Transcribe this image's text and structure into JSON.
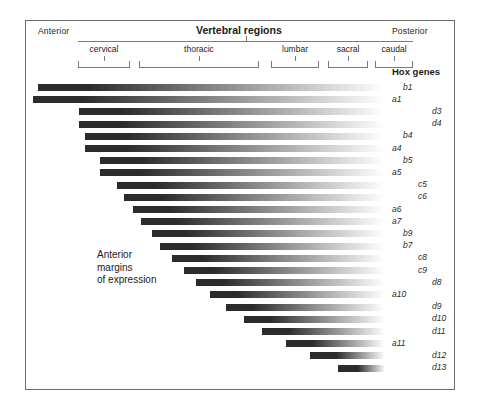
{
  "figure": {
    "title_main": "Vertebral regions",
    "anterior_label": "Anterior",
    "posterior_label": "Posterior",
    "hox_genes_label": "Hox genes",
    "annotation": "Anterior\nmargins\nof expression",
    "annotation_lines": [
      "Anterior",
      "margins",
      "of expression"
    ],
    "bar_color_dark": "#2b2b2b",
    "bar_color_light": "#ffffff",
    "frame_color": "#6e6e6e",
    "text_color": "#1b1b1b"
  },
  "regions": [
    {
      "name": "cervical",
      "x": 78,
      "width": 52
    },
    {
      "name": "thoracic",
      "x": 139,
      "width": 120
    },
    {
      "name": "lumbar",
      "x": 271,
      "width": 48
    },
    {
      "name": "sacral",
      "x": 328,
      "width": 40
    },
    {
      "name": "caudal",
      "x": 375,
      "width": 38
    }
  ],
  "chart_data": {
    "type": "bar",
    "xlabel": "Anterior — Posterior body axis",
    "ylabel": "Hox genes",
    "axis_note": "All expression domains extend to the posterior end; left edge marks the anterior margin.",
    "categories": [
      "b1",
      "a1",
      "d3",
      "d4",
      "b4",
      "a4",
      "b5",
      "a5",
      "c5",
      "c6",
      "a6",
      "a7",
      "b9",
      "b7",
      "c8",
      "c9",
      "d8",
      "a10",
      "d9",
      "d10",
      "d11",
      "a11",
      "d12",
      "d13"
    ],
    "bars": [
      {
        "gene": "b1",
        "cluster": "b",
        "paralog": 1,
        "start": 38,
        "end": 385,
        "indent": 1
      },
      {
        "gene": "a1",
        "cluster": "a",
        "paralog": 1,
        "start": 33,
        "end": 385,
        "indent": 0
      },
      {
        "gene": "d3",
        "cluster": "d",
        "paralog": 3,
        "start": 79,
        "end": 385,
        "indent": 3
      },
      {
        "gene": "d4",
        "cluster": "d",
        "paralog": 4,
        "start": 79,
        "end": 385,
        "indent": 3
      },
      {
        "gene": "b4",
        "cluster": "b",
        "paralog": 4,
        "start": 85,
        "end": 385,
        "indent": 1
      },
      {
        "gene": "a4",
        "cluster": "a",
        "paralog": 4,
        "start": 85,
        "end": 385,
        "indent": 0
      },
      {
        "gene": "b5",
        "cluster": "b",
        "paralog": 5,
        "start": 100,
        "end": 385,
        "indent": 1
      },
      {
        "gene": "a5",
        "cluster": "a",
        "paralog": 5,
        "start": 100,
        "end": 385,
        "indent": 0
      },
      {
        "gene": "c5",
        "cluster": "c",
        "paralog": 5,
        "start": 117,
        "end": 385,
        "indent": 2
      },
      {
        "gene": "c6",
        "cluster": "c",
        "paralog": 6,
        "start": 124,
        "end": 385,
        "indent": 2
      },
      {
        "gene": "a6",
        "cluster": "a",
        "paralog": 6,
        "start": 133,
        "end": 385,
        "indent": 0
      },
      {
        "gene": "a7",
        "cluster": "a",
        "paralog": 7,
        "start": 141,
        "end": 385,
        "indent": 0
      },
      {
        "gene": "b9",
        "cluster": "b",
        "paralog": 9,
        "start": 152,
        "end": 385,
        "indent": 1
      },
      {
        "gene": "b7",
        "cluster": "b",
        "paralog": 7,
        "start": 160,
        "end": 385,
        "indent": 1
      },
      {
        "gene": "c8",
        "cluster": "c",
        "paralog": 8,
        "start": 172,
        "end": 385,
        "indent": 2
      },
      {
        "gene": "c9",
        "cluster": "c",
        "paralog": 9,
        "start": 184,
        "end": 385,
        "indent": 2
      },
      {
        "gene": "d8",
        "cluster": "d",
        "paralog": 8,
        "start": 196,
        "end": 385,
        "indent": 3
      },
      {
        "gene": "a10",
        "cluster": "a",
        "paralog": 10,
        "start": 210,
        "end": 385,
        "indent": 0
      },
      {
        "gene": "d9",
        "cluster": "d",
        "paralog": 9,
        "start": 226,
        "end": 385,
        "indent": 3
      },
      {
        "gene": "d10",
        "cluster": "d",
        "paralog": 10,
        "start": 244,
        "end": 385,
        "indent": 3
      },
      {
        "gene": "d11",
        "cluster": "d",
        "paralog": 11,
        "start": 262,
        "end": 385,
        "indent": 3
      },
      {
        "gene": "a11",
        "cluster": "a",
        "paralog": 11,
        "start": 286,
        "end": 385,
        "indent": 0
      },
      {
        "gene": "d12",
        "cluster": "d",
        "paralog": 12,
        "start": 310,
        "end": 385,
        "indent": 3
      },
      {
        "gene": "d13",
        "cluster": "d",
        "paralog": 13,
        "start": 338,
        "end": 385,
        "indent": 3
      }
    ],
    "grid": false,
    "legend": "none"
  }
}
